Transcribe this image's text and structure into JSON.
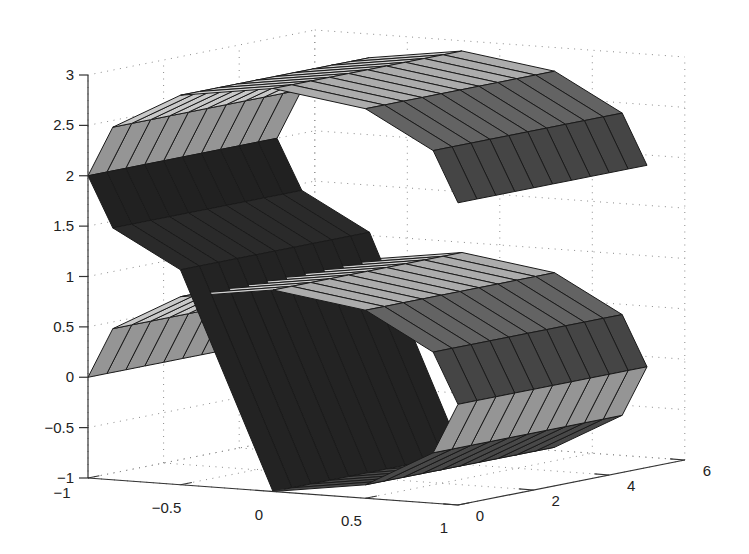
{
  "chart_data": {
    "type": "surface3d",
    "title": "",
    "xlabel": "",
    "ylabel": "",
    "zlabel": "",
    "xlim": [
      -1,
      1
    ],
    "ylim": [
      0,
      6
    ],
    "zlim": [
      -1,
      3
    ],
    "grid": true,
    "x_ticks": [
      -1,
      -0.5,
      0,
      0.5,
      1
    ],
    "y_ticks": [
      0,
      2,
      4,
      6
    ],
    "z_ticks": [
      -1,
      -0.5,
      0,
      0.5,
      1,
      1.5,
      2,
      2.5,
      3
    ],
    "x_tick_labels": [
      "−1",
      "−0.5",
      "0",
      "0.5",
      "1"
    ],
    "y_tick_labels": [
      "0",
      "2",
      "4",
      "6"
    ],
    "z_tick_labels": [
      "−1",
      "−0.5",
      "0",
      "0.5",
      "1",
      "1.5",
      "2",
      "2.5",
      "3"
    ],
    "surface": {
      "profile": [
        {
          "center_x": 0,
          "center_z": 0,
          "radius": 1,
          "start_deg": 180,
          "end_deg": -90,
          "segments": 9
        },
        {
          "center_x": 0,
          "center_z": 2,
          "radius": 1,
          "start_deg": 270,
          "end_deg": 0,
          "segments": 9
        }
      ],
      "extrusion_y": [
        0,
        5
      ],
      "extrusion_segments": 10,
      "edge_color": "#1a1a1a",
      "shading": "flat-gray"
    }
  },
  "colors": {
    "background": "#ffffff",
    "axis": "#333333",
    "grid": "#8a8a8a",
    "text": "#222222"
  }
}
